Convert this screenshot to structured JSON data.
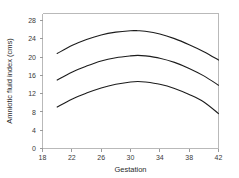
{
  "chart_data": {
    "type": "line",
    "title": "",
    "xlabel": "Gestation",
    "ylabel": "Amniotic fluid index (cms)",
    "xlim": [
      18,
      42
    ],
    "ylim": [
      0,
      29
    ],
    "xticks": [
      18,
      22,
      26,
      30,
      34,
      38,
      42
    ],
    "yticks": [
      0,
      4,
      8,
      12,
      16,
      20,
      24,
      28
    ],
    "grid": false,
    "legend": null,
    "series": [
      {
        "name": "upper-centile",
        "x": [
          20,
          22,
          24,
          26,
          28,
          30,
          31,
          32,
          34,
          36,
          38,
          40,
          42
        ],
        "values": [
          20.4,
          22.1,
          23.4,
          24.4,
          25.0,
          25.3,
          25.3,
          25.2,
          24.6,
          23.6,
          22.3,
          20.8,
          19.0
        ]
      },
      {
        "name": "median-centile",
        "x": [
          20,
          22,
          24,
          26,
          28,
          30,
          31,
          32,
          34,
          36,
          38,
          40,
          42
        ],
        "values": [
          14.7,
          16.4,
          17.7,
          18.8,
          19.5,
          19.9,
          20.0,
          19.9,
          19.4,
          18.5,
          17.2,
          15.6,
          13.6
        ]
      },
      {
        "name": "lower-centile",
        "x": [
          20,
          22,
          24,
          26,
          28,
          30,
          31,
          32,
          34,
          36,
          38,
          40,
          42
        ],
        "values": [
          8.9,
          10.6,
          11.9,
          13.0,
          13.8,
          14.3,
          14.4,
          14.3,
          13.8,
          12.9,
          11.6,
          10.0,
          7.5
        ]
      }
    ]
  },
  "axis": {
    "x_title": "Gestation",
    "y_title": "Amniotic fluid index (cms)",
    "x_tick_labels": [
      "18",
      "22",
      "26",
      "30",
      "34",
      "38",
      "42"
    ],
    "y_tick_labels": [
      "0",
      "4",
      "8",
      "12",
      "16",
      "20",
      "24",
      "28"
    ]
  },
  "colors": {
    "curve": "#1c1c1c",
    "frame": "#b9b9b9",
    "tick": "#9a9a9a",
    "text": "#2b2b2b",
    "background": "#ffffff"
  }
}
